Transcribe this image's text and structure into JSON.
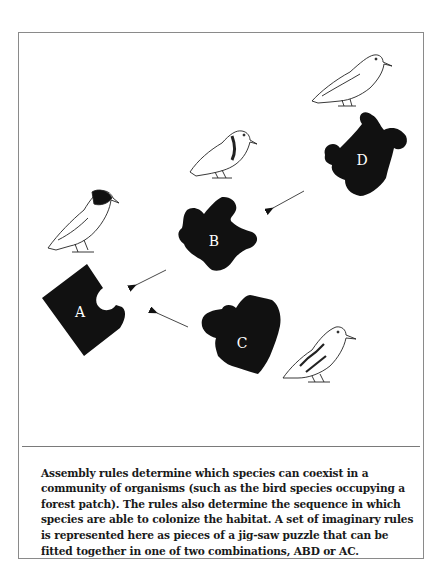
{
  "figure": {
    "pieces": [
      {
        "id": "A",
        "label": "A"
      },
      {
        "id": "B",
        "label": "B"
      },
      {
        "id": "C",
        "label": "C"
      },
      {
        "id": "D",
        "label": "D"
      }
    ],
    "arrows": [
      {
        "from": "D",
        "to": "B"
      },
      {
        "from": "B",
        "to": "A"
      },
      {
        "from": "C",
        "to": "A"
      }
    ],
    "birds": [
      {
        "near": "A",
        "name": "dark-headed bird"
      },
      {
        "near": "B",
        "name": "collared bird"
      },
      {
        "near": "C",
        "name": "barred-wing bird"
      },
      {
        "near": "D",
        "name": "pale long-billed bird"
      }
    ],
    "colors": {
      "piece": "#111111",
      "label": "#ffffff",
      "line": "#333333"
    }
  },
  "caption": {
    "text": "Assembly rules determine which species can coexist in a community of organisms (such as the bird species occupying a forest patch). The rules also determine the sequence in which species are able to colonize the habitat. A set of imaginary rules is represented here as pieces of a jig-saw puzzle that can be fitted together in one of two combinations, ABD or AC."
  }
}
